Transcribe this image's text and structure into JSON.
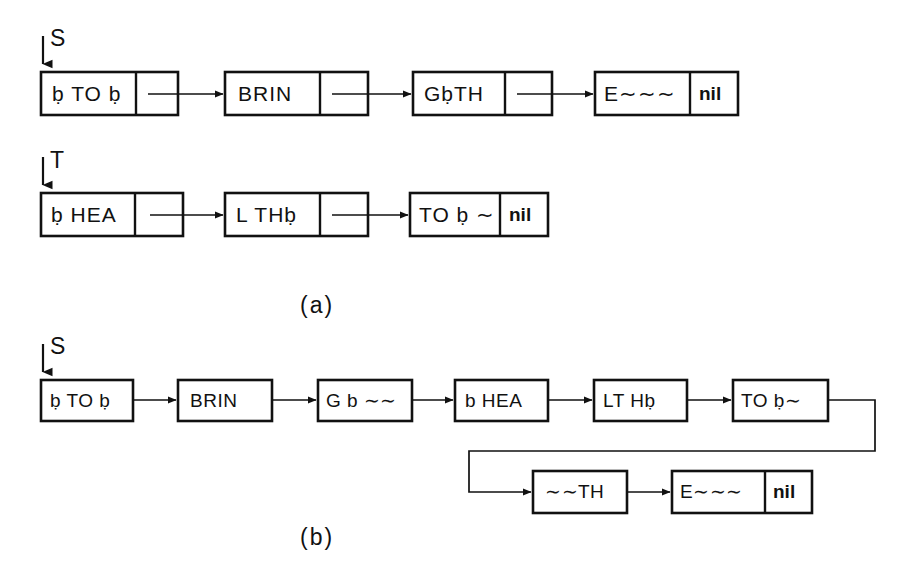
{
  "figure": {
    "background_color": "#ffffff",
    "ink_color": "#111111"
  },
  "captions": {
    "a": "(a)",
    "b": "(b)"
  },
  "pointers": {
    "s_top": "S",
    "t_mid": "T",
    "s_bottom": "S"
  },
  "part_a": {
    "list_s": {
      "head_label": "S",
      "nodes": [
        {
          "data": "ḅ TO ḅ",
          "link": "pointer"
        },
        {
          "data": "BRIN",
          "link": "pointer"
        },
        {
          "data": "GḅTH",
          "link": "pointer"
        },
        {
          "data": "E∼∼∼",
          "link": "nil"
        }
      ]
    },
    "list_t": {
      "head_label": "T",
      "nodes": [
        {
          "data": "ḅ HEA",
          "link": "pointer"
        },
        {
          "data": "L THḅ",
          "link": "pointer"
        },
        {
          "data": "TO ḅ ∼",
          "link": "nil"
        }
      ]
    }
  },
  "part_b": {
    "list_s": {
      "head_label": "S",
      "nodes": [
        {
          "data": "ḅ TO ḅ",
          "link": "pointer"
        },
        {
          "data": "BRIN",
          "link": "pointer"
        },
        {
          "data": "G b ∼∼",
          "link": "pointer"
        },
        {
          "data": "b HEA",
          "link": "pointer"
        },
        {
          "data": "LT Hḅ",
          "link": "pointer"
        },
        {
          "data": "TO ḅ∼",
          "link": "pointer"
        },
        {
          "data": "∼∼TH",
          "link": "pointer"
        },
        {
          "data": "E∼∼∼",
          "link": "nil"
        }
      ]
    }
  },
  "labels": {
    "nil": "nil"
  }
}
